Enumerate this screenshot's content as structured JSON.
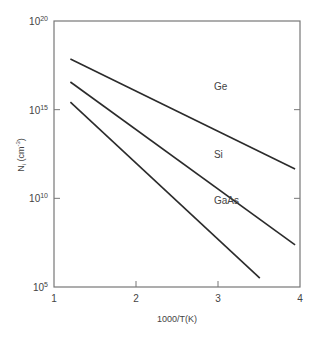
{
  "chart_data": {
    "type": "line",
    "title": "",
    "xlabel": "1000/T(K)",
    "ylabel": "N_i (cm^-3)",
    "ylabel_parts": {
      "main": "N",
      "sub": "i",
      "unit": "(cm",
      "exp": "-3",
      "close": ")"
    },
    "xlim": [
      1,
      4
    ],
    "ylim_log10": [
      5,
      20
    ],
    "yscale": "log",
    "grid": false,
    "x_ticks": [
      1,
      2,
      3,
      4
    ],
    "x_tick_labels": [
      "1",
      "2",
      "3",
      "4"
    ],
    "y_ticks_log10": [
      20,
      15,
      10,
      5
    ],
    "y_tick_labels": [
      {
        "base": "10",
        "exp": "20"
      },
      {
        "base": "10",
        "exp": "15"
      },
      {
        "base": "10",
        "exp": "10"
      },
      {
        "base": "10",
        "exp": "5"
      }
    ],
    "series": [
      {
        "name": "Ge",
        "x": [
          1.2,
          3.94
        ],
        "log10_y": [
          17.86,
          11.65
        ],
        "label_pos": [
          2.95,
          16.1
        ]
      },
      {
        "name": "Si",
        "x": [
          1.2,
          3.94
        ],
        "log10_y": [
          16.56,
          7.37
        ],
        "label_pos": [
          2.95,
          12.3
        ]
      },
      {
        "name": "GaAs",
        "x": [
          1.2,
          3.51
        ],
        "log10_y": [
          15.43,
          5.5
        ],
        "label_pos": [
          2.95,
          9.7
        ]
      }
    ]
  },
  "colors": {
    "line": "#2b2b2b",
    "axis": "#777777",
    "text": "#444444"
  }
}
